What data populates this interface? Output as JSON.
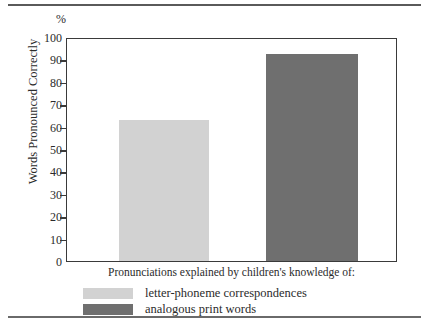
{
  "chart_data": {
    "type": "bar",
    "title": "",
    "xlabel": "Pronunciations explained by children's knowledge of:",
    "ylabel": "Words Pronounced Correctly",
    "unit_symbol": "%",
    "ylim": [
      0,
      100
    ],
    "ytick_step": 10,
    "yticks": [
      "100",
      "90",
      "80",
      "70",
      "60",
      "50",
      "40",
      "30",
      "20",
      "10",
      "0"
    ],
    "grid": false,
    "legend_position": "bottom-left",
    "categories": [
      "letter-phoneme correspondences",
      "analogous print words"
    ],
    "values": [
      63,
      92.5
    ],
    "colors": [
      "#d2d2d2",
      "#6f6f6f"
    ],
    "series": [
      {
        "name": "letter-phoneme correspondences",
        "value": 63,
        "color": "#d2d2d2"
      },
      {
        "name": "analogous print words",
        "value": 92.5,
        "color": "#6f6f6f"
      }
    ]
  },
  "figure": {
    "axis_color": "#3a3a3a",
    "rule_color": "#5a5a5a"
  }
}
